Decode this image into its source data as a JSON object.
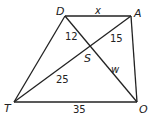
{
  "diagram": {
    "type": "trapezoid-with-diagonals",
    "vertices": {
      "D": {
        "label": "D",
        "x": 65,
        "y": 16
      },
      "A": {
        "label": "A",
        "x": 131,
        "y": 16
      },
      "T": {
        "label": "T",
        "x": 14,
        "y": 102
      },
      "O": {
        "label": "O",
        "x": 137,
        "y": 102
      },
      "S": {
        "label": "S",
        "x": 88,
        "y": 50
      }
    },
    "segment_labels": {
      "DA": "x",
      "DS": "12",
      "AS": "15",
      "TS": "25",
      "SO": "w",
      "TO": "35"
    },
    "stroke_color": "#222222"
  }
}
